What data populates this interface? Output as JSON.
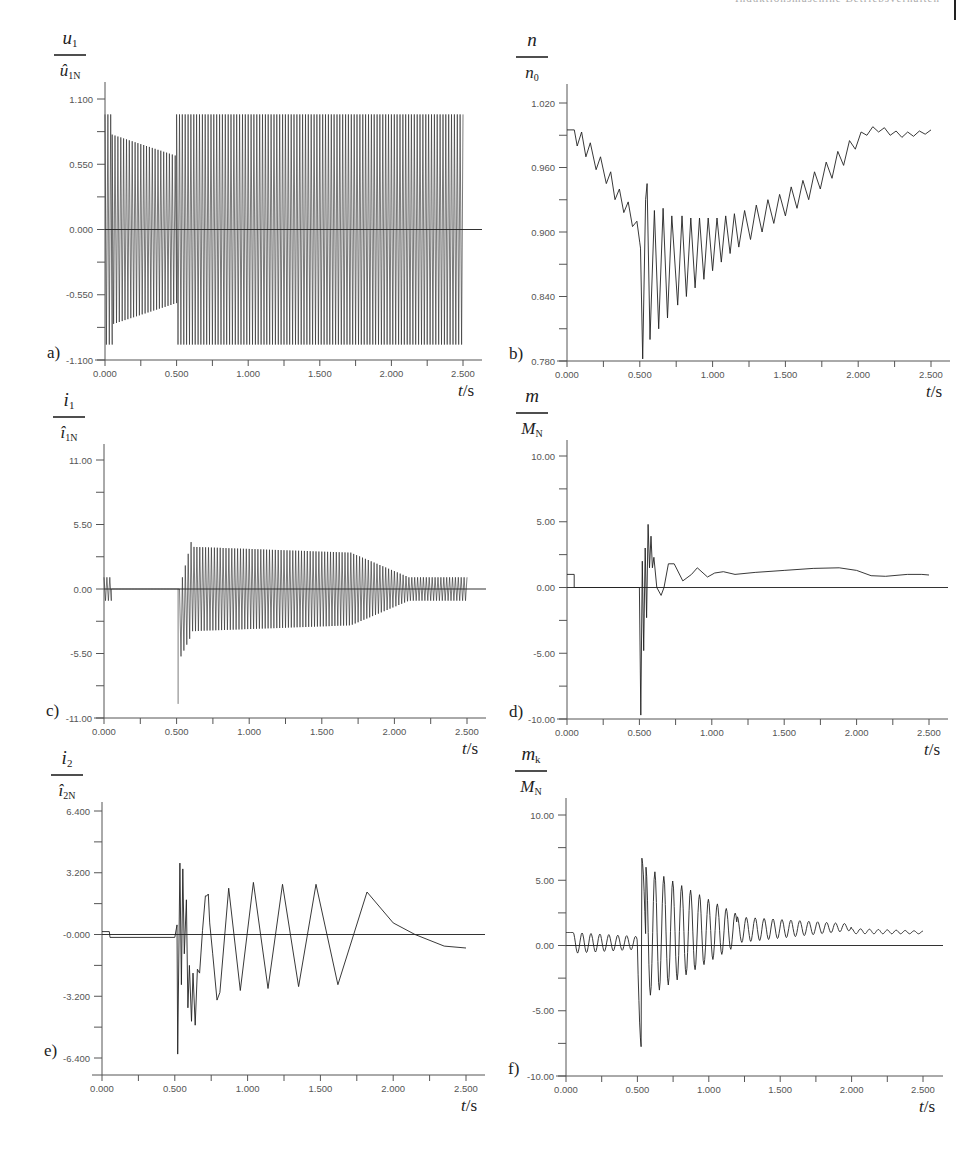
{
  "header": {
    "running_title": "Induktionsmaschine Betriebsverhalten"
  },
  "chart_data": [
    {
      "id": "a",
      "type": "line",
      "panel_label": "a)",
      "ylabel": {
        "num": "u",
        "num_sub": "1",
        "den": "û",
        "den_sub": "1N"
      },
      "xlabel": "t/s",
      "xlim": [
        0,
        2.5
      ],
      "ylim": [
        -1.1,
        1.1
      ],
      "xticks": [
        "0.000",
        "0.500",
        "1.000",
        "1.500",
        "2.000",
        "2.500"
      ],
      "yticks": [
        "1.100",
        "0.550",
        "0.000",
        "-0.550",
        "-1.100"
      ],
      "ytick_values": [
        1.1,
        0.55,
        0.0,
        -0.55,
        -1.1
      ],
      "description": "Dense 50 Hz stator voltage; amplitude ~0.97 at start, decays to ~0.62 at t=0.5 s, then restored to ~0.97 until 2.5 s",
      "signal": {
        "kind": "ac",
        "freq": 50,
        "segments": [
          {
            "t0": 0.0,
            "t1": 0.05,
            "a0": 0.97,
            "a1": 0.97
          },
          {
            "t0": 0.05,
            "t1": 0.5,
            "a0": 0.8,
            "a1": 0.62
          },
          {
            "t0": 0.5,
            "t1": 2.5,
            "a0": 0.97,
            "a1": 0.97
          }
        ]
      },
      "frame": {
        "x0": 105,
        "x1": 463,
        "xend": 482,
        "ytop": 99,
        "ybot": 360,
        "yaxis_top": 82
      }
    },
    {
      "id": "b",
      "type": "line",
      "panel_label": "b)",
      "ylabel": {
        "num": "n",
        "num_sub": "",
        "den": "n",
        "den_sub": "0"
      },
      "xlabel": "t/s",
      "xlim": [
        0,
        2.5
      ],
      "ylim": [
        0.78,
        1.02
      ],
      "xticks": [
        "0.000",
        "0.500",
        "1.000",
        "1.500",
        "2.000",
        "2.500"
      ],
      "yticks": [
        "1.020",
        "0.960",
        "0.900",
        "0.840",
        "0.780"
      ],
      "ytick_values": [
        1.02,
        0.96,
        0.9,
        0.84,
        0.78
      ],
      "description": "Speed ratio: starts 0.995, decays with small ripple to ~0.89 at 0.5 s, deep oscillation dip to ~0.78, recovers to ~0.995 at 2.0 s",
      "points": [
        [
          0.0,
          0.995
        ],
        [
          0.05,
          0.995
        ],
        [
          0.07,
          0.98
        ],
        [
          0.1,
          0.993
        ],
        [
          0.13,
          0.97
        ],
        [
          0.16,
          0.983
        ],
        [
          0.2,
          0.958
        ],
        [
          0.23,
          0.97
        ],
        [
          0.27,
          0.945
        ],
        [
          0.3,
          0.956
        ],
        [
          0.33,
          0.93
        ],
        [
          0.36,
          0.94
        ],
        [
          0.39,
          0.918
        ],
        [
          0.42,
          0.928
        ],
        [
          0.45,
          0.905
        ],
        [
          0.48,
          0.91
        ],
        [
          0.5,
          0.89
        ],
        [
          0.505,
          0.885
        ],
        [
          0.52,
          0.782
        ],
        [
          0.54,
          0.93
        ],
        [
          0.55,
          0.945
        ],
        [
          0.57,
          0.8
        ],
        [
          0.6,
          0.92
        ],
        [
          0.63,
          0.81
        ],
        [
          0.66,
          0.922
        ],
        [
          0.69,
          0.82
        ],
        [
          0.72,
          0.915
        ],
        [
          0.76,
          0.832
        ],
        [
          0.79,
          0.915
        ],
        [
          0.82,
          0.84
        ],
        [
          0.85,
          0.913
        ],
        [
          0.88,
          0.848
        ],
        [
          0.91,
          0.913
        ],
        [
          0.94,
          0.856
        ],
        [
          0.97,
          0.913
        ],
        [
          1.0,
          0.864
        ],
        [
          1.03,
          0.913
        ],
        [
          1.06,
          0.872
        ],
        [
          1.09,
          0.915
        ],
        [
          1.12,
          0.88
        ],
        [
          1.15,
          0.917
        ],
        [
          1.18,
          0.886
        ],
        [
          1.22,
          0.92
        ],
        [
          1.26,
          0.893
        ],
        [
          1.3,
          0.925
        ],
        [
          1.34,
          0.9
        ],
        [
          1.38,
          0.93
        ],
        [
          1.42,
          0.908
        ],
        [
          1.46,
          0.935
        ],
        [
          1.5,
          0.915
        ],
        [
          1.54,
          0.942
        ],
        [
          1.58,
          0.922
        ],
        [
          1.62,
          0.948
        ],
        [
          1.66,
          0.93
        ],
        [
          1.7,
          0.956
        ],
        [
          1.74,
          0.94
        ],
        [
          1.78,
          0.965
        ],
        [
          1.82,
          0.95
        ],
        [
          1.86,
          0.975
        ],
        [
          1.9,
          0.962
        ],
        [
          1.94,
          0.985
        ],
        [
          1.98,
          0.977
        ],
        [
          2.02,
          0.993
        ],
        [
          2.06,
          0.99
        ],
        [
          2.1,
          0.998
        ],
        [
          2.14,
          0.993
        ],
        [
          2.18,
          0.997
        ],
        [
          2.22,
          0.99
        ],
        [
          2.26,
          0.994
        ],
        [
          2.3,
          0.988
        ],
        [
          2.34,
          0.993
        ],
        [
          2.38,
          0.989
        ],
        [
          2.42,
          0.994
        ],
        [
          2.46,
          0.991
        ],
        [
          2.5,
          0.995
        ]
      ],
      "frame": {
        "x0": 567,
        "x1": 931,
        "xend": 950,
        "ytop": 103,
        "ybot": 361,
        "yaxis_top": 84
      }
    },
    {
      "id": "c",
      "type": "line",
      "panel_label": "c)",
      "ylabel": {
        "num": "i",
        "num_sub": "1",
        "den": "î",
        "den_sub": "1N"
      },
      "xlabel": "t/s",
      "xlim": [
        0,
        2.5
      ],
      "ylim": [
        -11,
        11
      ],
      "xticks": [
        "0.000",
        "0.500",
        "1.000",
        "1.500",
        "2.000",
        "2.500"
      ],
      "yticks": [
        "11.00",
        "5.50",
        "0.00",
        "-5.50",
        "-11.00"
      ],
      "ytick_values": [
        11,
        5.5,
        0,
        -5.5,
        -11
      ],
      "description": "Stator current: small ~1.0 oscillation to 0.05 s, zero until 0.5 s, spike to -9.8, large 50 Hz oscillation ~±3.5 decaying to ~±1 by 2.1 s",
      "signal": {
        "kind": "ac",
        "freq": 50,
        "spike": {
          "t": 0.51,
          "v": -9.8
        },
        "segments": [
          {
            "t0": 0.0,
            "t1": 0.05,
            "a0": 1.0,
            "a1": 1.0
          },
          {
            "t0": 0.05,
            "t1": 0.5,
            "a0": 0.0,
            "a1": 0.0
          },
          {
            "t0": 0.52,
            "t1": 0.6,
            "a0": 3.0,
            "a1": 4.0,
            "offset0": -3.0,
            "offset1": 0
          },
          {
            "t0": 0.6,
            "t1": 1.7,
            "a0": 3.6,
            "a1": 3.1
          },
          {
            "t0": 1.7,
            "t1": 2.1,
            "a0": 3.1,
            "a1": 1.0
          },
          {
            "t0": 2.1,
            "t1": 2.5,
            "a0": 1.0,
            "a1": 1.0
          }
        ]
      },
      "frame": {
        "x0": 104,
        "x1": 467,
        "xend": 486,
        "ytop": 460,
        "ybot": 718,
        "yaxis_top": 444
      }
    },
    {
      "id": "d",
      "type": "line",
      "panel_label": "d)",
      "ylabel": {
        "num": "m",
        "num_sub": "",
        "den": "M",
        "den_sub": "N"
      },
      "xlabel": "t/s",
      "xlim": [
        0,
        2.5
      ],
      "ylim": [
        -10,
        10
      ],
      "xticks": [
        "0.000",
        "0.500",
        "1.000",
        "1.500",
        "2.000",
        "2.500"
      ],
      "yticks": [
        "10.00",
        "5.00",
        "0.00",
        "-5.00",
        "-10.00"
      ],
      "ytick_values": [
        10,
        5,
        0,
        -5,
        -10
      ],
      "description": "Torque ratio: 1.0 until 0.05 s, zero until 0.5 s, transient from -9.7 to +4.8, settles ~1.0-1.5",
      "points": [
        [
          0.0,
          1.0
        ],
        [
          0.05,
          1.0
        ],
        [
          0.05,
          0.0
        ],
        [
          0.5,
          0.0
        ],
        [
          0.51,
          -9.7
        ],
        [
          0.52,
          2.0
        ],
        [
          0.53,
          -4.8
        ],
        [
          0.54,
          3.0
        ],
        [
          0.55,
          -2.3
        ],
        [
          0.56,
          4.8
        ],
        [
          0.57,
          1.5
        ],
        [
          0.58,
          3.9
        ],
        [
          0.59,
          1.5
        ],
        [
          0.6,
          2.3
        ],
        [
          0.62,
          0.0
        ],
        [
          0.65,
          -0.6
        ],
        [
          0.67,
          0.0
        ],
        [
          0.7,
          1.8
        ],
        [
          0.74,
          1.8
        ],
        [
          0.8,
          0.5
        ],
        [
          0.86,
          1.0
        ],
        [
          0.9,
          1.5
        ],
        [
          0.97,
          0.8
        ],
        [
          1.02,
          1.1
        ],
        [
          1.08,
          1.2
        ],
        [
          1.16,
          1.0
        ],
        [
          1.3,
          1.15
        ],
        [
          1.5,
          1.3
        ],
        [
          1.7,
          1.45
        ],
        [
          1.88,
          1.5
        ],
        [
          2.0,
          1.3
        ],
        [
          2.1,
          0.9
        ],
        [
          2.2,
          0.85
        ],
        [
          2.35,
          1.0
        ],
        [
          2.45,
          1.0
        ],
        [
          2.5,
          0.95
        ]
      ],
      "frame": {
        "x0": 567,
        "x1": 929,
        "xend": 948,
        "ytop": 456,
        "ybot": 719,
        "yaxis_top": 440
      }
    },
    {
      "id": "e",
      "type": "line",
      "panel_label": "e)",
      "ylabel": {
        "num": "i",
        "num_sub": "2",
        "den": "î",
        "den_sub": "2N"
      },
      "xlabel": "t/s",
      "xlim": [
        0,
        2.5
      ],
      "ylim": [
        -6.4,
        6.4
      ],
      "xticks": [
        "0.000",
        "0.500",
        "1.000",
        "1.500",
        "2.000",
        "2.500"
      ],
      "yticks": [
        "6.400",
        "3.200",
        "-0.000",
        "-3.200",
        "-6.400"
      ],
      "ytick_values": [
        6.4,
        3.2,
        0,
        -3.2,
        -6.4
      ],
      "description": "Rotor current: ~0.2 then -0.2 flat until 0.5 s, transient to -6.2 and +3.7, then low-frequency oscillations ~±2.8, final hump +2.2 at 1.82 s, drifts to -0.7",
      "points": [
        [
          0.0,
          0.15
        ],
        [
          0.05,
          0.15
        ],
        [
          0.055,
          -0.15
        ],
        [
          0.5,
          -0.15
        ],
        [
          0.515,
          0.5
        ],
        [
          0.52,
          -6.2
        ],
        [
          0.535,
          3.7
        ],
        [
          0.545,
          -2.6
        ],
        [
          0.555,
          3.4
        ],
        [
          0.565,
          -1.0
        ],
        [
          0.58,
          1.8
        ],
        [
          0.59,
          -3.8
        ],
        [
          0.6,
          -1.6
        ],
        [
          0.615,
          -4.5
        ],
        [
          0.625,
          -2.0
        ],
        [
          0.64,
          -4.7
        ],
        [
          0.655,
          -1.8
        ],
        [
          0.67,
          -2.0
        ],
        [
          0.69,
          0.2
        ],
        [
          0.71,
          2.0
        ],
        [
          0.72,
          2.0
        ],
        [
          0.73,
          2.1
        ],
        [
          0.74,
          0.6
        ],
        [
          0.76,
          -1.0
        ],
        [
          0.79,
          -3.4
        ],
        [
          0.81,
          -3.0
        ],
        [
          0.87,
          2.4
        ],
        [
          0.95,
          -2.9
        ],
        [
          1.04,
          2.7
        ],
        [
          1.14,
          -2.8
        ],
        [
          1.24,
          2.6
        ],
        [
          1.35,
          -2.7
        ],
        [
          1.47,
          2.6
        ],
        [
          1.62,
          -2.6
        ],
        [
          1.82,
          2.2
        ],
        [
          2.0,
          0.6
        ],
        [
          2.15,
          -0.0
        ],
        [
          2.35,
          -0.6
        ],
        [
          2.5,
          -0.7
        ]
      ],
      "frame": {
        "x0": 102,
        "x1": 466,
        "xend": 485,
        "ytop": 811,
        "ybot": 1058,
        "yaxis_top": 802,
        "xaxis_y": 1075
      }
    },
    {
      "id": "f",
      "type": "line",
      "panel_label": "f)",
      "ylabel": {
        "num": "m",
        "num_sub": "k",
        "den": "M",
        "den_sub": "N"
      },
      "xlabel": "t/s",
      "xlim": [
        0,
        2.5
      ],
      "ylim": [
        -10,
        10
      ],
      "xticks": [
        "0.000",
        "0.500",
        "1.000",
        "1.500",
        "2.000",
        "2.500"
      ],
      "yticks": [
        "10.00",
        "5.00",
        "0.00",
        "-5.00",
        "-10.00"
      ],
      "ytick_values": [
        10,
        5,
        0,
        -5,
        -10
      ],
      "description": "Coupling torque: 1.0 until 0.05 s, small oscillation ±0.6 around 0.2, dip to -8.2 at 0.52 s, peak +7.0 at 0.56 s, decaying oscillation settles near 1.0",
      "signal": {
        "kind": "damped",
        "freq": 16,
        "segments": [
          {
            "t0": 0.0,
            "t1": 0.05,
            "mean0": 1.0,
            "mean1": 1.0,
            "a0": 0.0,
            "a1": 0.0
          },
          {
            "t0": 0.05,
            "t1": 0.5,
            "mean0": 0.2,
            "mean1": 0.2,
            "a0": 0.8,
            "a1": 0.5
          },
          {
            "t0": 0.5,
            "t1": 0.56,
            "mean0": 0.0,
            "mean1": 0.0,
            "a0": 7.6,
            "a1": 7.0
          },
          {
            "t0": 0.56,
            "t1": 1.2,
            "mean0": 1.0,
            "mean1": 1.2,
            "a0": 5.0,
            "a1": 1.2
          },
          {
            "t0": 1.2,
            "t1": 2.0,
            "mean0": 1.2,
            "mean1": 1.4,
            "a0": 1.0,
            "a1": 0.25
          },
          {
            "t0": 2.0,
            "t1": 2.5,
            "mean0": 1.1,
            "mean1": 1.0,
            "a0": 0.2,
            "a1": 0.1
          }
        ]
      },
      "frame": {
        "x0": 566,
        "x1": 923,
        "xend": 943,
        "ytop": 815,
        "ybot": 1076,
        "yaxis_top": 798
      }
    }
  ]
}
